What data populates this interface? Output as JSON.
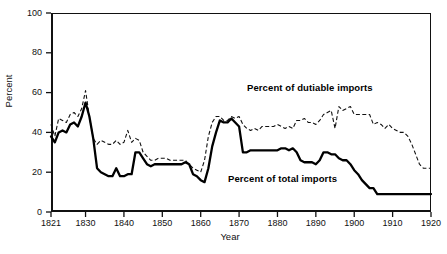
{
  "chart_data": {
    "type": "line",
    "title": "",
    "xlabel": "Year",
    "ylabel": "Percent",
    "xlim": [
      1821,
      1920
    ],
    "ylim": [
      0,
      100
    ],
    "grid": false,
    "legend_position": "inline-annotations",
    "x_ticks": [
      "1821",
      "1830",
      "1840",
      "1850",
      "1860",
      "1870",
      "1880",
      "1890",
      "1900",
      "1910",
      "1920"
    ],
    "x_tick_values": [
      1821,
      1830,
      1840,
      1850,
      1860,
      1870,
      1880,
      1890,
      1900,
      1910,
      1920
    ],
    "y_ticks": [
      "0",
      "20",
      "40",
      "60",
      "80",
      "100"
    ],
    "y_tick_values": [
      0,
      20,
      40,
      60,
      80,
      100
    ],
    "x": [
      1821,
      1822,
      1823,
      1824,
      1825,
      1826,
      1827,
      1828,
      1829,
      1830,
      1831,
      1832,
      1833,
      1834,
      1835,
      1836,
      1837,
      1838,
      1839,
      1840,
      1841,
      1842,
      1843,
      1844,
      1845,
      1846,
      1847,
      1848,
      1849,
      1850,
      1851,
      1852,
      1853,
      1854,
      1855,
      1856,
      1857,
      1858,
      1859,
      1860,
      1861,
      1862,
      1863,
      1864,
      1865,
      1866,
      1867,
      1868,
      1869,
      1870,
      1871,
      1872,
      1873,
      1874,
      1875,
      1876,
      1877,
      1878,
      1879,
      1880,
      1881,
      1882,
      1883,
      1884,
      1885,
      1886,
      1887,
      1888,
      1889,
      1890,
      1891,
      1892,
      1893,
      1894,
      1895,
      1896,
      1897,
      1898,
      1899,
      1900,
      1901,
      1902,
      1903,
      1904,
      1905,
      1906,
      1907,
      1908,
      1909,
      1910,
      1911,
      1912,
      1913,
      1914,
      1915,
      1916,
      1917,
      1918,
      1919,
      1920
    ],
    "series": [
      {
        "name": "Percent of dutiable imports",
        "style": "dashed",
        "color": "#111111",
        "values": [
          44,
          38,
          47,
          46,
          45,
          49,
          50,
          48,
          52,
          61,
          48,
          37,
          34,
          36,
          35,
          34,
          34,
          36,
          34,
          35,
          41,
          35,
          37,
          36,
          30,
          28,
          26,
          26,
          27,
          27,
          27,
          26,
          26,
          26,
          26,
          26,
          24,
          22,
          21,
          20,
          26,
          38,
          45,
          48,
          48,
          46,
          46,
          48,
          47,
          48,
          44,
          42,
          41,
          42,
          41,
          43,
          43,
          43,
          43,
          44,
          43,
          42,
          43,
          42,
          46,
          46,
          47,
          45,
          45,
          44,
          46,
          49,
          50,
          51,
          42,
          53,
          51,
          52,
          53,
          49,
          49,
          49,
          49,
          49,
          44,
          45,
          44,
          42,
          44,
          42,
          41,
          40,
          40,
          38,
          34,
          29,
          24,
          22,
          22,
          22
        ]
      },
      {
        "name": "Percent of total imports",
        "style": "solid",
        "color": "#000000",
        "values": [
          38,
          35,
          40,
          41,
          40,
          44,
          45,
          43,
          48,
          55,
          48,
          37,
          22,
          20,
          19,
          18,
          18,
          22,
          18,
          18,
          19,
          19,
          30,
          30,
          27,
          24,
          23,
          24,
          24,
          24,
          24,
          24,
          24,
          24,
          24,
          25,
          24,
          19,
          18,
          16,
          15,
          22,
          33,
          40,
          46,
          45,
          45,
          47,
          45,
          43,
          30,
          30,
          31,
          31,
          31,
          31,
          31,
          31,
          31,
          31,
          32,
          32,
          31,
          32,
          30,
          26,
          25,
          25,
          25,
          24,
          26,
          30,
          30,
          29,
          29,
          27,
          26,
          26,
          24,
          21,
          19,
          16,
          14,
          12,
          12,
          9,
          9,
          9,
          9,
          9,
          9,
          9,
          9,
          9,
          9,
          9,
          9,
          9,
          9,
          9
        ]
      }
    ],
    "annotations": [
      {
        "name": "dutiable-series-label",
        "text": "Percent of dutiable imports"
      },
      {
        "name": "total-series-label",
        "text": "Percent of total imports"
      }
    ]
  },
  "axes": {
    "ylabel": "Percent",
    "xlabel": "Year"
  }
}
